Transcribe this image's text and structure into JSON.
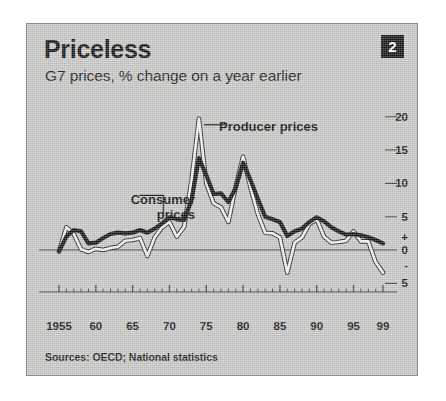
{
  "header": {
    "title": "Priceless",
    "subtitle": "G7 prices, % change on a year earlier",
    "badge": "2"
  },
  "footer": {
    "source": "Sources: OECD; National statistics"
  },
  "colors": {
    "panel_background": "#c9c9c7",
    "panel_border": "#8d8d8b",
    "consumer_line": "#131313",
    "producer_line": "#f4f4f2",
    "producer_outline": "#2b2b2b",
    "axis": "#3b3b3b",
    "badge_background": "#141414",
    "badge_text": "#ffffff",
    "text": "#111111"
  },
  "chart_data": {
    "type": "line",
    "title": "Priceless",
    "subtitle": "G7 prices, % change on a year earlier",
    "xlabel": "",
    "ylabel": "% change on a year earlier",
    "grid": false,
    "legend_position": "inline-annotations",
    "xlim": [
      1955,
      1999
    ],
    "ylim": [
      -6,
      21
    ],
    "yticks": [
      20,
      15,
      10,
      5,
      0,
      -5
    ],
    "ytick_labels": [
      "20",
      "15",
      "10",
      "5",
      "0",
      "5"
    ],
    "y_sign_markers": {
      "plus": "+",
      "minus": "-"
    },
    "xticks": [
      1955,
      1960,
      1965,
      1970,
      1975,
      1980,
      1985,
      1990,
      1995,
      1999
    ],
    "xtick_labels": [
      "1955",
      "60",
      "65",
      "70",
      "75",
      "80",
      "85",
      "90",
      "95",
      "99"
    ],
    "x": [
      1955,
      1956,
      1957,
      1958,
      1959,
      1960,
      1961,
      1962,
      1963,
      1964,
      1965,
      1966,
      1967,
      1968,
      1969,
      1970,
      1971,
      1972,
      1973,
      1974,
      1975,
      1976,
      1977,
      1978,
      1979,
      1980,
      1981,
      1982,
      1983,
      1984,
      1985,
      1986,
      1987,
      1988,
      1989,
      1990,
      1991,
      1992,
      1993,
      1994,
      1995,
      1996,
      1997,
      1998,
      1999
    ],
    "series": [
      {
        "name": "Consumer prices",
        "style": "thick-black",
        "values": [
          -0.2,
          2.0,
          3.0,
          2.8,
          1.0,
          1.1,
          1.8,
          2.4,
          2.6,
          2.5,
          2.6,
          3.0,
          2.6,
          3.2,
          4.0,
          4.9,
          4.6,
          4.5,
          7.5,
          13.8,
          11.2,
          8.4,
          8.5,
          7.2,
          9.3,
          13.1,
          10.5,
          7.7,
          5.0,
          4.6,
          4.2,
          2.1,
          2.8,
          3.2,
          4.2,
          4.9,
          4.3,
          3.4,
          2.8,
          2.3,
          2.4,
          2.2,
          1.9,
          1.5,
          1.0
        ]
      },
      {
        "name": "Producer prices",
        "style": "thin-white",
        "values": [
          -0.2,
          3.4,
          2.4,
          0.1,
          -0.3,
          0.2,
          0.0,
          0.3,
          0.5,
          1.4,
          1.5,
          1.8,
          -0.9,
          1.9,
          3.4,
          4.2,
          2.0,
          3.5,
          10.5,
          19.7,
          10.0,
          7.0,
          6.4,
          4.2,
          9.5,
          14.0,
          9.4,
          5.4,
          2.6,
          2.5,
          1.9,
          -3.4,
          1.1,
          1.9,
          3.9,
          4.6,
          2.0,
          1.1,
          1.2,
          1.4,
          2.8,
          1.3,
          1.3,
          -1.8,
          -3.4
        ]
      }
    ],
    "annotations": [
      {
        "text": "Producer prices",
        "target_series": "Producer prices",
        "target_x": 1974
      },
      {
        "text": "Consumer prices",
        "target_series": "Consumer prices",
        "target_x": 1970
      }
    ]
  }
}
